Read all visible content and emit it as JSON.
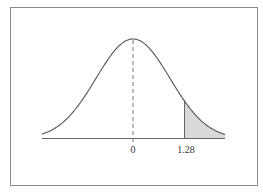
{
  "figure": {
    "title": "",
    "colors": {
      "frame": "#8a8a8a",
      "curve": "#555555",
      "axis": "#666666",
      "shade": "#d9d9d9",
      "mean_line": "#777777",
      "text": "#333333"
    },
    "x_axis": {
      "tick_labels": [
        "0",
        "1.28"
      ]
    },
    "mean_label": "0",
    "cutoff_label": "1.28"
  },
  "chart_data": {
    "type": "area",
    "title": "",
    "xlabel": "",
    "ylabel": "",
    "distribution": "standard normal",
    "mean": 0,
    "shaded_region": {
      "from": 1.28,
      "to": "right tail"
    },
    "tick_labels": [
      "0",
      "1.28"
    ],
    "mean_line": "dashed vertical at 0",
    "grid": false,
    "legend": false
  }
}
